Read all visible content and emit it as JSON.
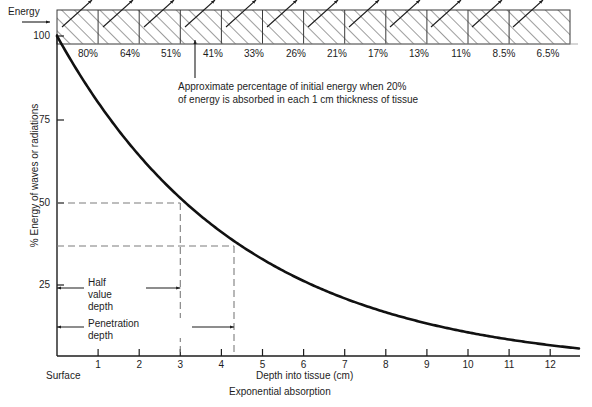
{
  "figure": {
    "caption": "Exponential absorption",
    "energy_label": "Energy",
    "surface_label": "Surface"
  },
  "annotation": {
    "line1": "Approximate percentage of initial energy when 20%",
    "line2": "of energy is absorbed in each 1 cm thickness of tissue"
  },
  "markers": {
    "half_value_depth": [
      "Half",
      "value",
      "depth"
    ],
    "half_value_depth_text": "Half value depth",
    "penetration_depth": [
      "Penetration",
      "depth"
    ],
    "penetration_depth_text": "Penetration depth",
    "half_value_depth_cm": 3,
    "penetration_depth_cm": 4.3,
    "half_value_depth_pct": 50,
    "penetration_depth_pct": 37
  },
  "chart_data": {
    "type": "line",
    "title": "Exponential absorption",
    "xlabel": "Depth into tissue (cm)",
    "ylabel": "% Energy of waves or radiations",
    "xlim": [
      0,
      13
    ],
    "ylim": [
      0,
      100
    ],
    "xticks": [
      1,
      2,
      3,
      4,
      5,
      6,
      7,
      8,
      9,
      10,
      11,
      12
    ],
    "xticklabels": [
      "1",
      "2",
      "3",
      "4",
      "5",
      "6",
      "7",
      "8",
      "9",
      "10",
      "11",
      "12"
    ],
    "yticks": [
      25,
      50,
      75,
      100
    ],
    "yticklabels": [
      "25",
      "50",
      "75",
      "100"
    ],
    "grid": false,
    "legend": null,
    "series": [
      {
        "name": "% Energy remaining",
        "x": [
          0,
          1,
          2,
          3,
          4,
          5,
          6,
          7,
          8,
          9,
          10,
          11,
          12,
          13
        ],
        "values": [
          100,
          80,
          64,
          51,
          41,
          33,
          26,
          21,
          17,
          13,
          11,
          8.5,
          6.5,
          5.5
        ]
      }
    ],
    "band": {
      "name": "Tissue slabs, 1 cm each, 20% absorbed per cm",
      "cells": [
        {
          "depth_cm": 1,
          "label": "80%"
        },
        {
          "depth_cm": 2,
          "label": "64%"
        },
        {
          "depth_cm": 3,
          "label": "51%"
        },
        {
          "depth_cm": 4,
          "label": "41%"
        },
        {
          "depth_cm": 5,
          "label": "33%"
        },
        {
          "depth_cm": 6,
          "label": "26%"
        },
        {
          "depth_cm": 7,
          "label": "21%"
        },
        {
          "depth_cm": 8,
          "label": "17%"
        },
        {
          "depth_cm": 9,
          "label": "13%"
        },
        {
          "depth_cm": 10,
          "label": "11%"
        },
        {
          "depth_cm": 11,
          "label": "8.5%"
        },
        {
          "depth_cm": 12,
          "label": "6.5%"
        }
      ]
    }
  }
}
